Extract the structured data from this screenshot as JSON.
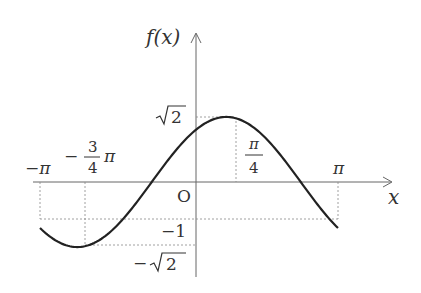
{
  "chart_data": {
    "type": "line",
    "function": "f(x) = sqrt(2) * sin(x + pi/4)",
    "domain": [
      -3.14159,
      3.14159
    ],
    "ylabel": "f(x)",
    "xlabel": "x",
    "origin_label": "O",
    "x_ticks": [
      {
        "value": -3.14159,
        "label": "-π"
      },
      {
        "value": -2.35619,
        "label": "-3/4 π"
      },
      {
        "value": 0.785398,
        "label": "π/4"
      },
      {
        "value": 3.14159,
        "label": "π"
      }
    ],
    "y_ticks": [
      {
        "value": 1.41421,
        "label": "√2"
      },
      {
        "value": -1,
        "label": "-1"
      },
      {
        "value": -1.41421,
        "label": "-√2"
      }
    ],
    "key_points": [
      {
        "x": -3.14159,
        "y": -1
      },
      {
        "x": -2.35619,
        "y": -1.41421
      },
      {
        "x": -0.785398,
        "y": 0
      },
      {
        "x": 0,
        "y": 1
      },
      {
        "x": 0.785398,
        "y": 1.41421
      },
      {
        "x": 2.35619,
        "y": 0
      },
      {
        "x": 3.14159,
        "y": -1
      }
    ],
    "grid": false,
    "guide_lines": "dashed"
  },
  "labels": {
    "y_axis": "f(x)",
    "x_axis": "x",
    "origin": "O",
    "neg_pi": "−π",
    "neg_three_quarter_num": "3",
    "neg_three_quarter_den": "4",
    "neg_three_quarter_sign": "−",
    "pi_symbol": "π",
    "quarter_pi_num": "π",
    "quarter_pi_den": "4",
    "pi": "π",
    "sqrt2": "2",
    "neg_one": "−1",
    "neg_sqrt2": "2",
    "minus": "−"
  }
}
